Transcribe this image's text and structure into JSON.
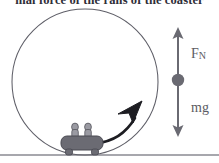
{
  "figure": {
    "caption": "mal force of the rails of the coaster",
    "background_color": "#ffffff",
    "loop": {
      "name": "roller coaster vertical loop",
      "shape": "circle",
      "center_x": 85,
      "center_y": 82,
      "radius": 73,
      "stroke_color": "#5f5f68",
      "stroke_width": 1
    },
    "ground": {
      "label": "ground line",
      "y": 155,
      "color": "#8a8a92"
    },
    "cart": {
      "name": "roller coaster car",
      "riders": 2,
      "wheels": 2,
      "body_color": "#6b6b73",
      "rider_color": "#9a9aa2",
      "position_x": 82,
      "position_y": 143
    },
    "motion_arrow": {
      "name": "direction of motion",
      "color": "#1d1d22",
      "description": "curved arrow indicating clockwise motion up the right side of the loop"
    },
    "free_body_diagram": {
      "name": "free body diagram",
      "axis_x": 178,
      "top_y": 28,
      "bottom_y": 136,
      "dot_y": 80,
      "dot_radius": 6,
      "color": "#6a6a72",
      "vectors": [
        {
          "id": "normal-force",
          "label": "F",
          "subscript": "N",
          "direction": "up",
          "meaning": "normal force"
        },
        {
          "id": "weight",
          "label": "mg",
          "subscript": "",
          "direction": "down",
          "meaning": "weight"
        }
      ]
    }
  }
}
